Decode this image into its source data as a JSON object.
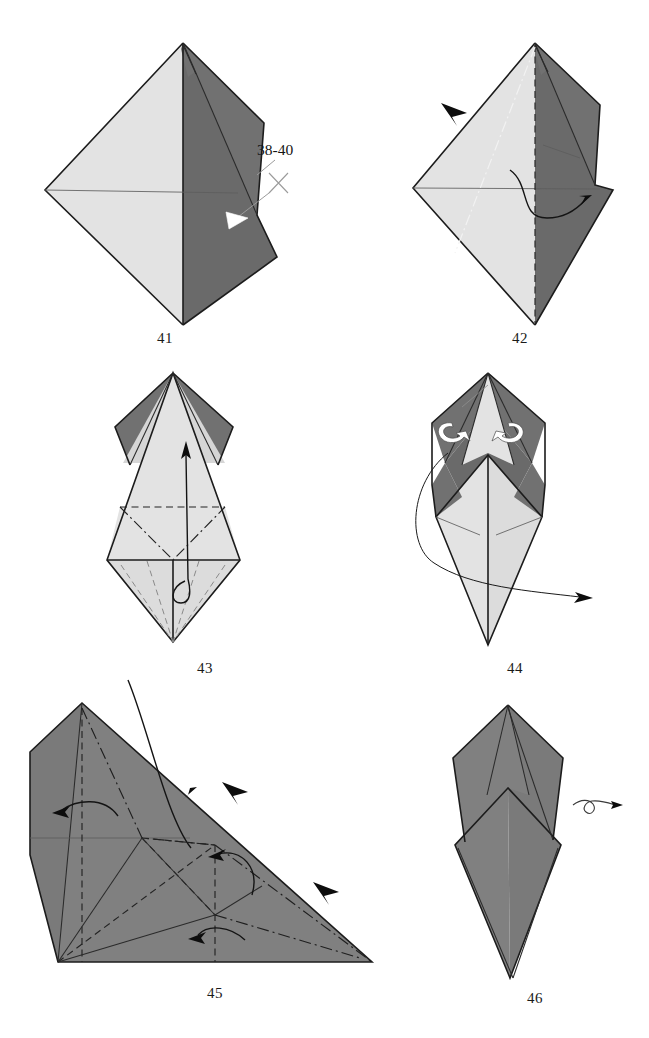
{
  "page": {
    "kind": "origami-instruction-diagram",
    "width": 649,
    "height": 1038,
    "background": "#ffffff",
    "paper_colors": {
      "light_front": "#e3e3e3",
      "mid_front": "#d6d6d6",
      "dark_back": "#717171",
      "gray_back": "#808080",
      "edge_stroke": "#1c1c1c",
      "crease_stroke": "#5d5d5d"
    }
  },
  "figures": [
    {
      "id": "fig-41",
      "number": "41",
      "caption": "41",
      "callout": {
        "text": "38-40",
        "symbol": "x-mark",
        "arrowhead": "white-triangle"
      },
      "annotations": [
        "repeat-steps-38-40-marker",
        "white-inset-arrowhead"
      ]
    },
    {
      "id": "fig-42",
      "number": "42",
      "caption": "42",
      "annotations": [
        "valley-fold-vertical-dashed",
        "mountain-fold-diagonal-dashdot",
        "curved-fold-arrow",
        "black-repeat-arrowhead"
      ]
    },
    {
      "id": "fig-43",
      "number": "43",
      "caption": "43",
      "annotations": [
        "horizontal-valley-fold-dashed",
        "v-shaped-mountain-fold",
        "hidden-edges-dashed",
        "long-upward-pull-arrow"
      ]
    },
    {
      "id": "fig-44",
      "number": "44",
      "caption": "44",
      "annotations": [
        "white-roll-arrow-left",
        "white-roll-arrow-right",
        "large-turn-over-sweep-arrow"
      ]
    },
    {
      "id": "fig-45",
      "number": "45",
      "caption": "45",
      "annotations": [
        "vertical-valley-fold-dashed",
        "diagonal-mountain-folds-dashdot",
        "curved-fold-arrow-upper-left",
        "curved-fold-arrow-upper-right",
        "curved-fold-arrow-middle",
        "curved-fold-arrow-lower",
        "black-repeat-arrowhead-upper",
        "black-repeat-arrowhead-lower"
      ]
    },
    {
      "id": "fig-46",
      "number": "46",
      "caption": "46",
      "annotations": [
        "rotate-turn-over-symbol"
      ]
    }
  ]
}
